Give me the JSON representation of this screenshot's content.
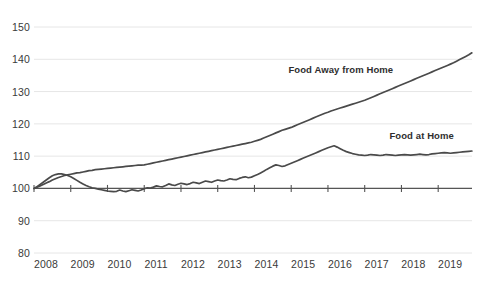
{
  "chart_data": {
    "type": "line",
    "title": "",
    "subtitle": "",
    "xlabel": "",
    "ylabel": "",
    "xlim": [
      2008.0,
      2019.92
    ],
    "ylim": [
      80,
      150
    ],
    "yticks": [
      80,
      90,
      100,
      110,
      120,
      130,
      140,
      150
    ],
    "xticks": [
      2008,
      2009,
      2010,
      2011,
      2012,
      2013,
      2014,
      2015,
      2016,
      2017,
      2018,
      2019
    ],
    "grid": true,
    "legend_position": "inline-annotation",
    "baseline": 100,
    "line_color": "#4a4a4a",
    "grid_color": "#e6e6e6",
    "text_color": "#3a3a3a",
    "annotations": [
      {
        "text": "Food Away from Home",
        "x": 2016.35,
        "y": 137.0
      },
      {
        "text": "Food at Home",
        "x": 2018.55,
        "y": 116.5
      }
    ],
    "series": [
      {
        "name": "Food Away from Home",
        "x": [
          2008.0,
          2008.083,
          2008.167,
          2008.25,
          2008.333,
          2008.417,
          2008.5,
          2008.583,
          2008.667,
          2008.75,
          2008.833,
          2008.917,
          2009.0,
          2009.083,
          2009.167,
          2009.25,
          2009.333,
          2009.417,
          2009.5,
          2009.583,
          2009.667,
          2009.75,
          2009.833,
          2009.917,
          2010.0,
          2010.083,
          2010.167,
          2010.25,
          2010.333,
          2010.417,
          2010.5,
          2010.583,
          2010.667,
          2010.75,
          2010.833,
          2010.917,
          2011.0,
          2011.083,
          2011.167,
          2011.25,
          2011.333,
          2011.417,
          2011.5,
          2011.583,
          2011.667,
          2011.75,
          2011.833,
          2011.917,
          2012.0,
          2012.083,
          2012.167,
          2012.25,
          2012.333,
          2012.417,
          2012.5,
          2012.583,
          2012.667,
          2012.75,
          2012.833,
          2012.917,
          2013.0,
          2013.083,
          2013.167,
          2013.25,
          2013.333,
          2013.417,
          2013.5,
          2013.583,
          2013.667,
          2013.75,
          2013.833,
          2013.917,
          2014.0,
          2014.083,
          2014.167,
          2014.25,
          2014.333,
          2014.417,
          2014.5,
          2014.583,
          2014.667,
          2014.75,
          2014.833,
          2014.917,
          2015.0,
          2015.083,
          2015.167,
          2015.25,
          2015.333,
          2015.417,
          2015.5,
          2015.583,
          2015.667,
          2015.75,
          2015.833,
          2015.917,
          2016.0,
          2016.083,
          2016.167,
          2016.25,
          2016.333,
          2016.417,
          2016.5,
          2016.583,
          2016.667,
          2016.75,
          2016.833,
          2016.917,
          2017.0,
          2017.083,
          2017.167,
          2017.25,
          2017.333,
          2017.417,
          2017.5,
          2017.583,
          2017.667,
          2017.75,
          2017.833,
          2017.917,
          2018.0,
          2018.083,
          2018.167,
          2018.25,
          2018.333,
          2018.417,
          2018.5,
          2018.583,
          2018.667,
          2018.75,
          2018.833,
          2018.917,
          2019.0,
          2019.083,
          2019.167,
          2019.25,
          2019.333,
          2019.417,
          2019.5,
          2019.583,
          2019.667,
          2019.75,
          2019.833,
          2019.917
        ],
        "values": [
          100.0,
          100.4,
          100.8,
          101.2,
          101.7,
          102.1,
          102.6,
          103.0,
          103.4,
          103.7,
          104.0,
          104.2,
          104.4,
          104.6,
          104.8,
          104.9,
          105.1,
          105.3,
          105.5,
          105.6,
          105.8,
          105.9,
          106.0,
          106.1,
          106.2,
          106.3,
          106.4,
          106.5,
          106.6,
          106.7,
          106.8,
          106.9,
          107.0,
          107.1,
          107.2,
          107.2,
          107.3,
          107.5,
          107.7,
          107.9,
          108.1,
          108.3,
          108.5,
          108.7,
          108.9,
          109.1,
          109.3,
          109.5,
          109.7,
          109.9,
          110.1,
          110.3,
          110.5,
          110.7,
          110.9,
          111.1,
          111.3,
          111.5,
          111.7,
          111.9,
          112.1,
          112.3,
          112.5,
          112.7,
          112.9,
          113.1,
          113.3,
          113.5,
          113.7,
          113.9,
          114.1,
          114.3,
          114.6,
          114.9,
          115.2,
          115.6,
          116.0,
          116.4,
          116.8,
          117.2,
          117.6,
          118.0,
          118.3,
          118.6,
          118.9,
          119.3,
          119.7,
          120.1,
          120.5,
          120.9,
          121.3,
          121.7,
          122.1,
          122.5,
          122.9,
          123.3,
          123.6,
          124.0,
          124.3,
          124.6,
          124.9,
          125.2,
          125.5,
          125.8,
          126.1,
          126.4,
          126.7,
          127.0,
          127.3,
          127.7,
          128.1,
          128.5,
          128.9,
          129.3,
          129.7,
          130.1,
          130.5,
          130.9,
          131.3,
          131.7,
          132.1,
          132.5,
          132.9,
          133.3,
          133.7,
          134.1,
          134.5,
          134.9,
          135.3,
          135.7,
          136.1,
          136.5,
          136.9,
          137.3,
          137.7,
          138.1,
          138.5,
          138.9,
          139.4,
          139.9,
          140.4,
          140.9,
          141.4,
          142.0
        ]
      },
      {
        "name": "Food at Home",
        "x": [
          2008.0,
          2008.083,
          2008.167,
          2008.25,
          2008.333,
          2008.417,
          2008.5,
          2008.583,
          2008.667,
          2008.75,
          2008.833,
          2008.917,
          2009.0,
          2009.083,
          2009.167,
          2009.25,
          2009.333,
          2009.417,
          2009.5,
          2009.583,
          2009.667,
          2009.75,
          2009.833,
          2009.917,
          2010.0,
          2010.083,
          2010.167,
          2010.25,
          2010.333,
          2010.417,
          2010.5,
          2010.583,
          2010.667,
          2010.75,
          2010.833,
          2010.917,
          2011.0,
          2011.083,
          2011.167,
          2011.25,
          2011.333,
          2011.417,
          2011.5,
          2011.583,
          2011.667,
          2011.75,
          2011.833,
          2011.917,
          2012.0,
          2012.083,
          2012.167,
          2012.25,
          2012.333,
          2012.417,
          2012.5,
          2012.583,
          2012.667,
          2012.75,
          2012.833,
          2012.917,
          2013.0,
          2013.083,
          2013.167,
          2013.25,
          2013.333,
          2013.417,
          2013.5,
          2013.583,
          2013.667,
          2013.75,
          2013.833,
          2013.917,
          2014.0,
          2014.083,
          2014.167,
          2014.25,
          2014.333,
          2014.417,
          2014.5,
          2014.583,
          2014.667,
          2014.75,
          2014.833,
          2014.917,
          2015.0,
          2015.083,
          2015.167,
          2015.25,
          2015.333,
          2015.417,
          2015.5,
          2015.583,
          2015.667,
          2015.75,
          2015.833,
          2015.917,
          2016.0,
          2016.083,
          2016.167,
          2016.25,
          2016.333,
          2016.417,
          2016.5,
          2016.583,
          2016.667,
          2016.75,
          2016.833,
          2016.917,
          2017.0,
          2017.083,
          2017.167,
          2017.25,
          2017.333,
          2017.417,
          2017.5,
          2017.583,
          2017.667,
          2017.75,
          2017.833,
          2017.917,
          2018.0,
          2018.083,
          2018.167,
          2018.25,
          2018.333,
          2018.417,
          2018.5,
          2018.583,
          2018.667,
          2018.75,
          2018.833,
          2018.917,
          2019.0,
          2019.083,
          2019.167,
          2019.25,
          2019.333,
          2019.417,
          2019.5,
          2019.583,
          2019.667,
          2019.75,
          2019.833,
          2019.917
        ],
        "values": [
          100.0,
          100.5,
          101.2,
          101.9,
          102.6,
          103.3,
          103.9,
          104.3,
          104.5,
          104.5,
          104.3,
          104.0,
          103.6,
          103.1,
          102.5,
          101.9,
          101.4,
          100.9,
          100.5,
          100.2,
          100.0,
          99.8,
          99.6,
          99.4,
          99.2,
          99.1,
          99.0,
          99.1,
          99.5,
          99.2,
          99.0,
          99.3,
          99.6,
          99.4,
          99.2,
          99.5,
          99.9,
          100.2,
          100.1,
          100.4,
          100.8,
          100.6,
          100.5,
          100.9,
          101.4,
          101.1,
          100.9,
          101.3,
          101.6,
          101.4,
          101.2,
          101.5,
          101.9,
          101.7,
          101.5,
          101.9,
          102.3,
          102.1,
          101.9,
          102.3,
          102.6,
          102.4,
          102.3,
          102.6,
          103.0,
          102.8,
          102.7,
          103.1,
          103.4,
          103.6,
          103.3,
          103.5,
          103.9,
          104.3,
          104.8,
          105.3,
          105.9,
          106.4,
          106.9,
          107.3,
          107.1,
          106.8,
          107.0,
          107.4,
          107.8,
          108.2,
          108.6,
          109.0,
          109.4,
          109.8,
          110.2,
          110.6,
          111.0,
          111.4,
          111.8,
          112.2,
          112.6,
          112.9,
          113.2,
          112.8,
          112.3,
          111.8,
          111.4,
          111.1,
          110.8,
          110.6,
          110.4,
          110.3,
          110.2,
          110.3,
          110.5,
          110.4,
          110.3,
          110.2,
          110.3,
          110.5,
          110.4,
          110.3,
          110.2,
          110.3,
          110.4,
          110.5,
          110.4,
          110.3,
          110.4,
          110.5,
          110.6,
          110.5,
          110.4,
          110.5,
          110.7,
          110.8,
          110.9,
          111.0,
          111.1,
          111.0,
          110.9,
          111.0,
          111.1,
          111.2,
          111.3,
          111.4,
          111.5,
          111.6
        ]
      }
    ]
  }
}
